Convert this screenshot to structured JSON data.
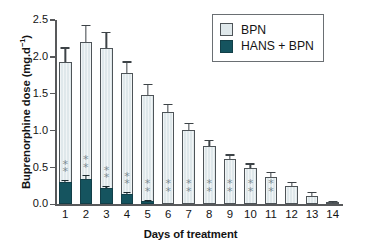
{
  "chart_data": {
    "type": "bar",
    "title": "",
    "xlabel": "Days of treatment",
    "ylabel_text": "Buprenorphine dose (mg.d",
    "ylabel_sup": "−1",
    "ylabel_tail": ")",
    "ylabel_full": "Buprenorphine dose (mg.d−1)",
    "categories": [
      "1",
      "2",
      "3",
      "4",
      "5",
      "6",
      "7",
      "8",
      "9",
      "10",
      "11",
      "12",
      "13",
      "14"
    ],
    "ylim": [
      0.0,
      2.5
    ],
    "yticks": [
      "0.0",
      "0.5",
      "1.0",
      "1.5",
      "2.0",
      "2.5"
    ],
    "ytick_values": [
      0.0,
      0.5,
      1.0,
      1.5,
      2.0,
      2.5
    ],
    "grid": false,
    "legend_position": "top-right",
    "series": [
      {
        "name": "BPN",
        "color": "#dfe8eb",
        "values": [
          1.93,
          2.2,
          2.12,
          1.78,
          1.49,
          1.25,
          1.01,
          0.79,
          0.61,
          0.49,
          0.37,
          0.25,
          0.12,
          0.02
        ],
        "errors": [
          0.18,
          0.22,
          0.2,
          0.14,
          0.13,
          0.1,
          0.08,
          0.07,
          0.05,
          0.05,
          0.05,
          0.04,
          0.03,
          0.01
        ]
      },
      {
        "name": "HANS + BPN",
        "color": "#15545f",
        "values": [
          0.3,
          0.35,
          0.22,
          0.14,
          0.04,
          0,
          0,
          0,
          0,
          0,
          0,
          0,
          0,
          0
        ],
        "errors": [
          0.02,
          0.03,
          0.02,
          0.015,
          0.01,
          0,
          0,
          0,
          0,
          0,
          0,
          0,
          0,
          0
        ]
      }
    ],
    "annotations": {
      "symbol": "*",
      "per_bar_count": [
        2,
        2,
        2,
        2,
        2,
        2,
        2,
        2,
        2,
        2,
        2,
        0,
        0,
        0
      ],
      "note": "two asterisks marked on days 1-11"
    }
  },
  "legend": {
    "items": [
      {
        "label": "BPN",
        "swatch": "light-blue-square"
      },
      {
        "label": "HANS + BPN",
        "swatch": "dark-teal-square"
      }
    ]
  },
  "colors": {
    "bpn_fill": "#dfe8eb",
    "hans_fill": "#15545f",
    "axis": "#58595b",
    "text": "#141414",
    "asterisk": "#7b8b91"
  }
}
